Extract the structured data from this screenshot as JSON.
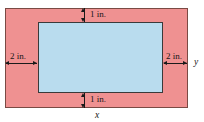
{
  "figure": {
    "outer_region": {
      "name": "page-area",
      "fill_color": "#ef9191",
      "border_color": "#7a4a44"
    },
    "inner_region": {
      "name": "printed-area",
      "fill_color": "#b9dcee",
      "border_color": "#3a3a3a"
    },
    "dimensions": {
      "top_margin": "1 in.",
      "bottom_margin": "1 in.",
      "left_margin": "2 in.",
      "right_margin": "2 in."
    },
    "axis_labels": {
      "width": "x",
      "height": "y"
    }
  }
}
